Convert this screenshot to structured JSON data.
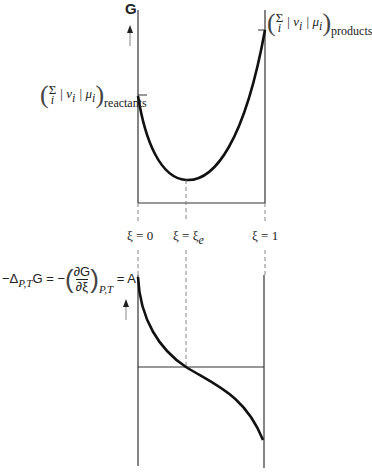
{
  "top_plot": {
    "y_axis_label": "G",
    "reactants_label": {
      "prefix": "Σ",
      "index": "i",
      "body": "| ν",
      "body_sub": "i",
      "mid": " | μ",
      "mid_sub": "i",
      "subscript": "reactants"
    },
    "products_label": {
      "prefix": "Σ",
      "index": "i",
      "body": "| ν",
      "body_sub": "i",
      "mid": " | μ",
      "mid_sub": "i",
      "subscript": "products"
    }
  },
  "x_markers": [
    {
      "label": "ξ = 0"
    },
    {
      "label": "ξ = ξ",
      "sub": "e"
    },
    {
      "label": "ξ = 1"
    }
  ],
  "bottom_plot": {
    "equation": {
      "lhs": "−Δ",
      "lhs_sub": "P,T",
      "lhs_G": "G = −",
      "frac_num": "∂G",
      "frac_den": "∂ξ",
      "rhs_sub": "P,T",
      "rhs": "= A"
    }
  },
  "colors": {
    "curve": "#111111",
    "axis": "#333333",
    "dashed": "#777777"
  }
}
